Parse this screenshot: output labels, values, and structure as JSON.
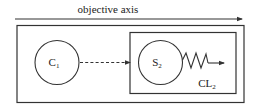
{
  "axis": {
    "label": "objective axis"
  },
  "nodes": {
    "c1": {
      "label_main": "C",
      "label_sub": "1",
      "shape": "circle"
    },
    "s2": {
      "label_main": "S",
      "label_sub": "2",
      "shape": "circle"
    }
  },
  "groups": {
    "cl2": {
      "label_main": "CL",
      "label_sub": "2"
    }
  },
  "edges": [
    {
      "from": "C1",
      "to": "S2",
      "style": "dashed-arrow"
    },
    {
      "from": "S2",
      "to": "out",
      "style": "zigzag-arrow"
    }
  ],
  "colors": {
    "stroke": "#333333",
    "text": "#222222",
    "background": "#ffffff"
  }
}
